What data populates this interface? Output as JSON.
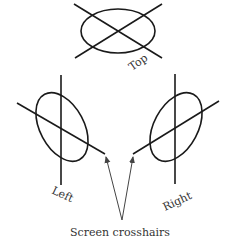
{
  "diagram": {
    "views": [
      {
        "id": "top",
        "label": "Top"
      },
      {
        "id": "left",
        "label": "Left"
      },
      {
        "id": "right",
        "label": "Right"
      }
    ],
    "caption": "Screen crosshairs",
    "colors": {
      "line": "#1a1a1a",
      "arrow": "#444444",
      "text": "#333333"
    }
  }
}
